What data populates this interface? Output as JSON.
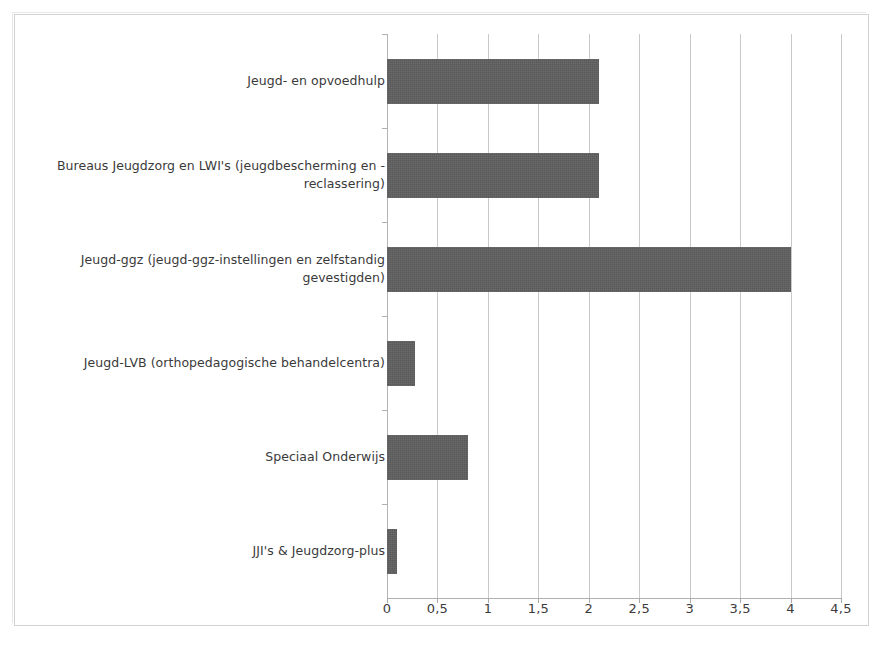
{
  "chart_data": {
    "type": "bar",
    "orientation": "horizontal",
    "title": "",
    "subtitle": "",
    "xlabel": "",
    "ylabel": "",
    "categories": [
      "Jeugd- en opvoedhulp",
      "Bureaus Jeugdzorg en LWI's (jeugdbescherming en -reclassering)",
      "Jeugd-ggz (jeugd-ggz-instellingen en zelfstandig gevestigden)",
      "Jeugd-LVB (orthopedagogische behandelcentra)",
      "Speciaal Onderwijs",
      "JJI's & Jeugdzorg-plus"
    ],
    "values": [
      2.1,
      2.1,
      4.0,
      0.28,
      0.8,
      0.1
    ],
    "xlim": [
      0,
      4.5
    ],
    "xticks": [
      0,
      0.5,
      1,
      1.5,
      2,
      2.5,
      3,
      3.5,
      4,
      4.5
    ],
    "xticklabels": [
      "0",
      "0,5",
      "1",
      "1,5",
      "2",
      "2,5",
      "3",
      "3,5",
      "4",
      "4,5"
    ],
    "grid": "vertical",
    "legend": "none",
    "bar_color": "#595959",
    "gridline_color": "#c9c9c9",
    "axis_color": "#b0b0b0",
    "background_color": "#ffffff",
    "frame_color": "#d2d2d2"
  }
}
